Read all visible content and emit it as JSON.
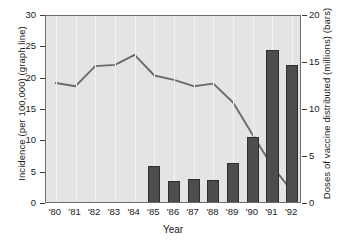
{
  "chart_data": {
    "type": "bar",
    "title": "",
    "xlabel": "Year",
    "categories": [
      "'80",
      "'81",
      "'82",
      "'83",
      "'84",
      "'85",
      "'86",
      "'87",
      "'88",
      "'89",
      "'90",
      "'91",
      "'92"
    ],
    "grid": "vertical",
    "legend_position": "none",
    "axes": {
      "left": {
        "label": "Incidence (per 100,000) (graph line)",
        "ticks": [
          0,
          5,
          10,
          15,
          20,
          25,
          30
        ],
        "tick_labels": [
          "0",
          "5",
          "10",
          "15",
          "20",
          "25",
          "30"
        ],
        "min": 0,
        "max": 30
      },
      "right": {
        "label": "Doses of vaccine distributed (millions) (bars)",
        "ticks": [
          0,
          5,
          10,
          15,
          20
        ],
        "tick_labels": [
          "0",
          "5",
          "10",
          "15",
          "20"
        ],
        "min": 0,
        "max": 20
      }
    },
    "series": [
      {
        "name": "Incidence (per 100,000)",
        "render": "line",
        "axis": "left",
        "color": "#6b6b6b",
        "x": [
          "'80",
          "'81",
          "'82",
          "'83",
          "'84",
          "'85",
          "'86",
          "'87",
          "'88",
          "'89",
          "'90",
          "'91",
          "'92"
        ],
        "values": [
          19.3,
          18.8,
          22.0,
          22.2,
          23.8,
          20.5,
          19.8,
          18.8,
          19.2,
          16.2,
          11.0,
          6.0,
          2.0
        ]
      },
      {
        "name": "Doses of vaccine distributed (millions)",
        "render": "bar",
        "axis": "right",
        "color": "#4d4d4d",
        "x": [
          "'80",
          "'81",
          "'82",
          "'83",
          "'84",
          "'85",
          "'86",
          "'87",
          "'88",
          "'89",
          "'90",
          "'91",
          "'92"
        ],
        "values": [
          null,
          null,
          null,
          null,
          null,
          4.0,
          2.5,
          2.7,
          2.6,
          4.4,
          7.1,
          16.4,
          14.8
        ]
      }
    ]
  }
}
